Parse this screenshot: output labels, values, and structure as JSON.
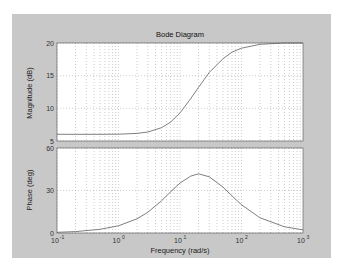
{
  "figure": {
    "title": "Bode Diagram",
    "background": "#c8c8c8",
    "plot_background": "#ffffff",
    "curve_color": "#707070",
    "grid_color": "#9a9a9a"
  },
  "chart_data": [
    {
      "type": "line",
      "title": "Bode Diagram",
      "panel": "magnitude",
      "xlabel": "Frequency  (rad/s)",
      "ylabel": "Magnitude  (dB)",
      "xscale": "log",
      "xlim": [
        0.1,
        1000
      ],
      "ylim": [
        5,
        20
      ],
      "yticks": [
        5,
        10,
        15,
        20
      ],
      "ytick_labels": [
        "5",
        "10",
        "15",
        "20"
      ],
      "grid": true,
      "x": [
        0.1,
        0.2,
        0.5,
        1,
        2,
        3,
        5,
        7,
        10,
        15,
        20,
        30,
        50,
        70,
        100,
        200,
        500,
        1000
      ],
      "series": [
        {
          "name": "Magnitude",
          "values": [
            6.02,
            6.02,
            6.03,
            6.04,
            6.17,
            6.38,
            7.04,
            7.88,
            9.3,
            11.5,
            13.2,
            15.5,
            17.6,
            18.6,
            19.2,
            19.8,
            20.0,
            20.0
          ]
        }
      ]
    },
    {
      "type": "line",
      "panel": "phase",
      "xlabel": "Frequency  (rad/s)",
      "ylabel": "Phase  (deg)",
      "xscale": "log",
      "xlim": [
        0.1,
        1000
      ],
      "ylim": [
        0,
        60
      ],
      "yticks": [
        0,
        30,
        60
      ],
      "ytick_labels": [
        "0",
        "30",
        "60"
      ],
      "xticks": [
        0.1,
        1,
        10,
        100,
        1000
      ],
      "xtick_labels": [
        {
          "base": "10",
          "exp": "-1"
        },
        {
          "base": "10",
          "exp": "0"
        },
        {
          "base": "10",
          "exp": "1"
        },
        {
          "base": "10",
          "exp": "2"
        },
        {
          "base": "10",
          "exp": "3"
        }
      ],
      "grid": true,
      "x": [
        0.1,
        0.2,
        0.5,
        1,
        2,
        3,
        5,
        7,
        10,
        15,
        20,
        30,
        50,
        70,
        100,
        200,
        500,
        1000
      ],
      "series": [
        {
          "name": "Phase",
          "values": [
            0.5,
            1.0,
            2.6,
            5.1,
            10.0,
            14.6,
            22.7,
            29.0,
            35.3,
            40.2,
            41.8,
            39.7,
            32.4,
            26.2,
            19.9,
            10.7,
            4.4,
            2.2
          ]
        }
      ]
    }
  ]
}
